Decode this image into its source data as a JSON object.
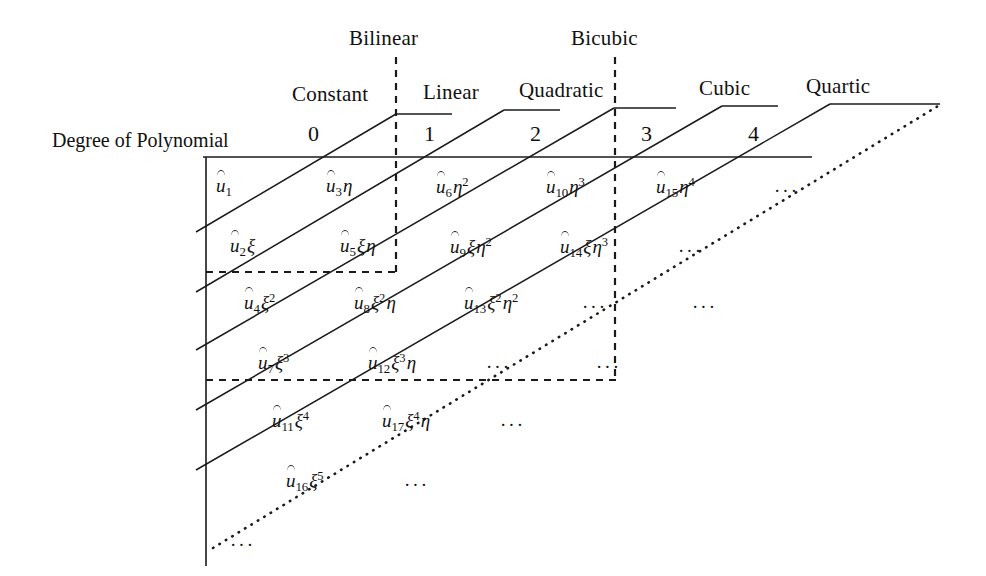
{
  "figure": {
    "kind": "pascal-triangle-polynomial-terms",
    "axis_title": "Degree of Polynomial",
    "degree_ticks": [
      "0",
      "1",
      "2",
      "3",
      "4"
    ],
    "diagonal_group_labels": [
      "Constant",
      "Linear",
      "Quadratic",
      "Cubic",
      "Quartic"
    ],
    "box_labels": [
      "Bilinear",
      "Bicubic"
    ],
    "ellipsis": "···",
    "line_color": "#1a1a1a"
  },
  "rows": [
    {
      "index": 0,
      "cells": [
        {
          "coef": "1",
          "xi": "",
          "eta": ""
        },
        {
          "coef": "3",
          "xi": "",
          "eta": "1"
        },
        {
          "coef": "6",
          "xi": "",
          "eta": "2"
        },
        {
          "coef": "10",
          "xi": "",
          "eta": "3"
        },
        {
          "coef": "15",
          "xi": "",
          "eta": "4"
        },
        {
          "ellipsis": true
        }
      ]
    },
    {
      "index": 1,
      "cells": [
        {
          "coef": "2",
          "xi": "1",
          "eta": ""
        },
        {
          "coef": "5",
          "xi": "1",
          "eta": "1"
        },
        {
          "coef": "9",
          "xi": "1",
          "eta": "2"
        },
        {
          "coef": "14",
          "xi": "1",
          "eta": "3"
        },
        {
          "ellipsis": true
        }
      ]
    },
    {
      "index": 2,
      "cells": [
        {
          "coef": "4",
          "xi": "2",
          "eta": ""
        },
        {
          "coef": "8",
          "xi": "2",
          "eta": "1"
        },
        {
          "coef": "13",
          "xi": "2",
          "eta": "2"
        },
        {
          "ellipsis": true
        },
        {
          "ellipsis": true
        }
      ]
    },
    {
      "index": 3,
      "cells": [
        {
          "coef": "7",
          "xi": "3",
          "eta": ""
        },
        {
          "coef": "12",
          "xi": "3",
          "eta": "1"
        },
        {
          "ellipsis": true
        },
        {
          "ellipsis": true
        }
      ]
    },
    {
      "index": 4,
      "cells": [
        {
          "coef": "11",
          "xi": "4",
          "eta": ""
        },
        {
          "coef": "17",
          "xi": "4",
          "eta": "1"
        },
        {
          "ellipsis": true
        }
      ]
    },
    {
      "index": 5,
      "cells": [
        {
          "coef": "16",
          "xi": "5",
          "eta": ""
        },
        {
          "ellipsis": true
        }
      ]
    },
    {
      "index": 6,
      "cells": [
        {
          "ellipsis": true
        }
      ]
    }
  ],
  "terms_flat": [
    "û1",
    "û3η",
    "û6η²",
    "û10η³",
    "û15η⁴",
    "û2ξ",
    "û5ξη",
    "û9ξη²",
    "û14ξη³",
    "û4ξ²",
    "û8ξ²η",
    "û13ξ²η²",
    "û7ξ³",
    "û12ξ³η",
    "û11ξ⁴",
    "û17ξ⁴η",
    "û16ξ⁵"
  ]
}
